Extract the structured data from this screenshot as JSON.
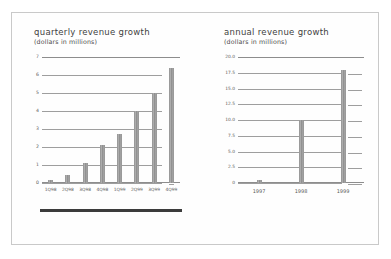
{
  "document": {
    "background_color": "#ffffff",
    "sheet_color": "#fefefe",
    "border_color": "#c9c9c9",
    "ink_color": "#4a4a4a",
    "bar_color": "#8f8f8f",
    "grid_color": "#9e9e9e"
  },
  "charts": [
    {
      "id": "quarterly-revenue-growth",
      "chart_data": {
        "type": "bar",
        "title": "quarterly revenue growth",
        "subtitle": "(dollars in millions)",
        "xlabel": "",
        "ylabel": "",
        "ylim": [
          0,
          7
        ],
        "yticks": [
          "0",
          "1",
          "2",
          "3",
          "4",
          "5",
          "6",
          "7"
        ],
        "ytick_values": [
          0,
          1,
          2,
          3,
          4,
          5,
          6,
          7
        ],
        "grid": true,
        "legend": "none",
        "categories": [
          "1Q98",
          "2Q98",
          "3Q98",
          "4Q98",
          "1Q99",
          "2Q99",
          "3Q99",
          "4Q99"
        ],
        "values": [
          0.15,
          0.45,
          1.1,
          2.1,
          2.7,
          4.0,
          5.0,
          6.4
        ]
      }
    },
    {
      "id": "annual-revenue-growth",
      "chart_data": {
        "type": "bar",
        "title": "annual revenue growth",
        "subtitle": "(dollars in millions)",
        "xlabel": "",
        "ylabel": "",
        "ylim": [
          0,
          20
        ],
        "yticks": [
          "0",
          "2.5",
          "5.0",
          "7.5",
          "10.0",
          "12.5",
          "15.0",
          "17.5",
          "20.0"
        ],
        "ytick_values": [
          0,
          2.5,
          5.0,
          7.5,
          10.0,
          12.5,
          15.0,
          17.5,
          20.0
        ],
        "grid": true,
        "legend": "none",
        "categories": [
          "1997",
          "1998",
          "1999"
        ],
        "values": [
          0.5,
          10.0,
          18.0
        ]
      }
    }
  ]
}
